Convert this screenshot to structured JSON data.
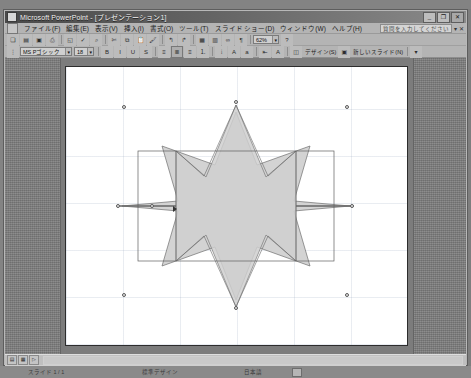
{
  "window": {
    "app_name": "Microsoft PowerPoint",
    "document_title": "[プレゼンテーション1]",
    "title": "Microsoft PowerPoint - [プレゼンテーション1]",
    "icon": "powerpoint-icon",
    "controls": {
      "minimize": "_",
      "restore": "❐",
      "close": "✕"
    }
  },
  "menubar": {
    "doc_icon": "document-icon",
    "items": [
      {
        "label": "ファイル(F)"
      },
      {
        "label": "編集(E)"
      },
      {
        "label": "表示(V)"
      },
      {
        "label": "挿入(I)"
      },
      {
        "label": "書式(O)"
      },
      {
        "label": "ツール(T)"
      },
      {
        "label": "スライド ショー(D)"
      },
      {
        "label": "ウィンドウ(W)"
      },
      {
        "label": "ヘルプ(H)"
      }
    ],
    "ask_a_question": {
      "placeholder": "質問を入力してください",
      "value": "",
      "dropdown_glyph": "▾",
      "close_glyph": "✕"
    }
  },
  "standard_toolbar": {
    "buttons": [
      {
        "name": "new-icon",
        "glyph": "❏"
      },
      {
        "name": "open-icon",
        "glyph": "▤"
      },
      {
        "name": "save-icon",
        "glyph": "▣"
      },
      {
        "name": "print-icon",
        "glyph": "⎙"
      },
      {
        "name": "print-preview-icon",
        "glyph": "◱"
      },
      {
        "name": "spelling-icon",
        "glyph": "✓"
      },
      {
        "name": "research-icon",
        "glyph": "⌕"
      },
      {
        "name": "cut-icon",
        "glyph": "✄"
      },
      {
        "name": "copy-icon",
        "glyph": "⧉"
      },
      {
        "name": "paste-icon",
        "glyph": "📋"
      },
      {
        "name": "format-painter-icon",
        "glyph": "🖌"
      },
      {
        "name": "undo-icon",
        "glyph": "↰"
      },
      {
        "name": "redo-icon",
        "glyph": "↱"
      },
      {
        "name": "insert-table-icon",
        "glyph": "▦"
      },
      {
        "name": "insert-chart-icon",
        "glyph": "▥"
      },
      {
        "name": "hyperlink-icon",
        "glyph": "∞"
      },
      {
        "name": "show-formatting-icon",
        "glyph": "¶"
      }
    ],
    "zoom": {
      "value": "62%",
      "arrow": "▾"
    },
    "help_icon": "?"
  },
  "formatting_toolbar": {
    "font": {
      "value": "MS Pゴシック",
      "arrow": "▾"
    },
    "size": {
      "value": "18",
      "arrow": "▾"
    },
    "bold": "B",
    "italic": "I",
    "underline": "U",
    "shadow": "S",
    "buttons": [
      {
        "name": "align-left-icon",
        "glyph": "≡"
      },
      {
        "name": "align-center-icon",
        "glyph": "≣"
      },
      {
        "name": "align-right-icon",
        "glyph": "≡"
      },
      {
        "name": "numbering-icon",
        "glyph": "⒈"
      },
      {
        "name": "bullets-icon",
        "glyph": "⦙"
      },
      {
        "name": "increase-font-icon",
        "glyph": "A"
      },
      {
        "name": "decrease-font-icon",
        "glyph": "a"
      },
      {
        "name": "decrease-indent-icon",
        "glyph": "⇤"
      },
      {
        "name": "font-color-icon",
        "glyph": "A"
      }
    ],
    "design_button": {
      "label": "デザイン(S)",
      "icon": "design-icon"
    },
    "new_slide_button": {
      "label": "新しいスライド(N)",
      "icon": "new-slide-icon"
    },
    "toolbar_options": "▾"
  },
  "slide_area": {
    "zoom_label": "62%",
    "shapes": [
      {
        "name": "8-point-star-back",
        "type": "star",
        "points": 8,
        "fill": "#d6d6d6",
        "stroke": "#6b6b6b",
        "rotation_deg": 22.5,
        "selected": false
      },
      {
        "name": "8-point-star-front",
        "type": "star",
        "points": 8,
        "fill": "#cfcfcf",
        "stroke": "#777777",
        "rotation_deg": 0,
        "selected": true
      }
    ],
    "selection_handles": 8,
    "cursor": "move-cursor"
  },
  "status_toolbar": {
    "buttons": [
      {
        "name": "normal-view-icon",
        "glyph": "▤"
      },
      {
        "name": "slide-sorter-view-icon",
        "glyph": "▦"
      },
      {
        "name": "slide-show-view-icon",
        "glyph": "▷"
      }
    ]
  },
  "drawing_toolbar": {
    "draw_menu": {
      "label": "図形の調整(R)",
      "arrow": "▾"
    },
    "select_objects_icon": "↖",
    "autoshapes_menu": {
      "label": "オートシェイプ(U)",
      "arrow": "▾"
    },
    "tools": [
      {
        "name": "line-icon",
        "glyph": "╲"
      },
      {
        "name": "arrow-icon",
        "glyph": "↘"
      },
      {
        "name": "rectangle-icon",
        "glyph": "▭"
      },
      {
        "name": "oval-icon",
        "glyph": "◯"
      },
      {
        "name": "text-box-icon",
        "glyph": "▤"
      },
      {
        "name": "wordart-icon",
        "glyph": "◢"
      },
      {
        "name": "diagram-icon",
        "glyph": "◬"
      },
      {
        "name": "clip-art-icon",
        "glyph": "❀"
      },
      {
        "name": "picture-icon",
        "glyph": "▧"
      },
      {
        "name": "fill-color-icon",
        "glyph": "▣"
      },
      {
        "name": "line-color-icon",
        "glyph": "⌒"
      },
      {
        "name": "font-color-icon",
        "glyph": "A"
      },
      {
        "name": "line-style-icon",
        "glyph": "≡"
      },
      {
        "name": "dash-style-icon",
        "glyph": "┅"
      },
      {
        "name": "arrow-style-icon",
        "glyph": "⇉"
      },
      {
        "name": "shadow-style-icon",
        "glyph": "◨"
      },
      {
        "name": "3d-style-icon",
        "glyph": "◰"
      }
    ]
  },
  "taskbar": {
    "slide_indicator": "スライド 1 / 1",
    "design_template": "標準デザイン",
    "language": "日本語",
    "overtype_indicator": "OI"
  }
}
